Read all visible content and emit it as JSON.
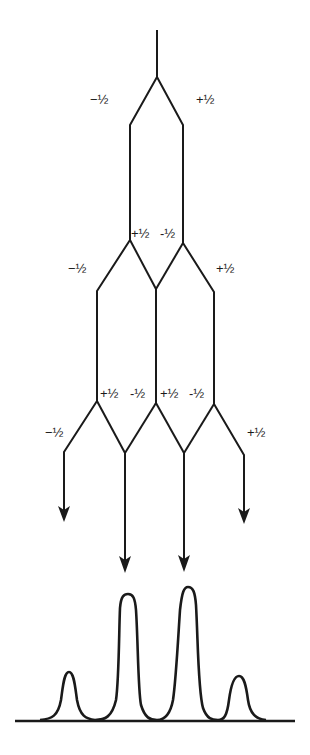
{
  "diagram": {
    "title": "",
    "type": "splitting-tree",
    "levels": [
      {
        "level": 1,
        "labels": [
          {
            "id": "l1-left",
            "text": "−½"
          },
          {
            "id": "l1-right",
            "text": "+½"
          }
        ]
      },
      {
        "level": 2,
        "labels": [
          {
            "id": "l2-inner-left",
            "text": "+½"
          },
          {
            "id": "l2-inner-right",
            "text": "-½"
          },
          {
            "id": "l2-outer-left",
            "text": "−½"
          },
          {
            "id": "l2-outer-right",
            "text": "+½"
          }
        ]
      },
      {
        "level": 3,
        "labels": [
          {
            "id": "l3-a",
            "text": "+½"
          },
          {
            "id": "l3-b",
            "text": "-½"
          },
          {
            "id": "l3-c",
            "text": "+½"
          },
          {
            "id": "l3-d",
            "text": "-½"
          },
          {
            "id": "l3-outer-left",
            "text": "−½"
          },
          {
            "id": "l3-outer-right",
            "text": "+½"
          }
        ]
      }
    ],
    "spectrum": {
      "peaks": [
        {
          "position": "outer-left",
          "relative_height": 1
        },
        {
          "position": "inner-left",
          "relative_height": 3
        },
        {
          "position": "inner-right",
          "relative_height": 3
        },
        {
          "position": "outer-right",
          "relative_height": 1
        }
      ]
    },
    "colors": {
      "ink": "#1a1a1a",
      "background": "#ffffff"
    }
  }
}
